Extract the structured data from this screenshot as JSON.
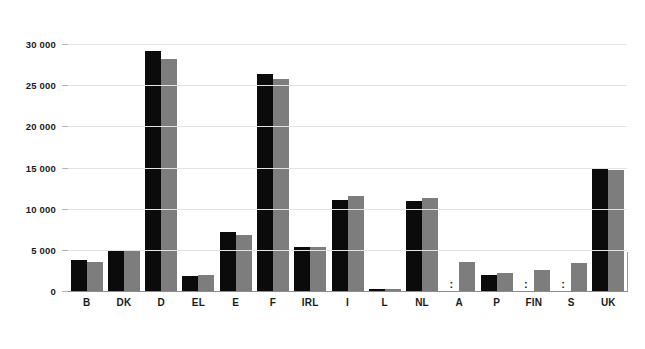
{
  "chart_data": {
    "type": "bar",
    "title": "",
    "subtitle": "",
    "xlabel": "",
    "ylabel": "",
    "ylim": [
      0,
      31000
    ],
    "grid": true,
    "legend_position": "none",
    "y_ticks": [
      0,
      5000,
      10000,
      15000,
      20000,
      25000,
      30000
    ],
    "y_tick_labels": [
      "0",
      "5 000",
      "10 000",
      "15 000",
      "20 000",
      "25 000",
      "30 000"
    ],
    "thousands_separator": " ",
    "na_symbol": ":",
    "colors": {
      "series_1": "#0b0b0b",
      "series_2": "#7d7d7d",
      "gridline": "#e3e3e3",
      "axis": "#8c8c8c",
      "background": "#ffffff",
      "text": "#1a1a1a"
    },
    "categories": [
      "B",
      "DK",
      "D",
      "EL",
      "E",
      "F",
      "IRL",
      "I",
      "L",
      "NL",
      "A",
      "P",
      "FIN",
      "S",
      "UK"
    ],
    "series": [
      {
        "name": "series_1",
        "color": "#0b0b0b",
        "values": [
          3750,
          4800,
          29100,
          1800,
          7200,
          26300,
          5350,
          11100,
          200,
          10900,
          null,
          1900,
          null,
          null,
          14850
        ]
      },
      {
        "name": "series_2",
        "color": "#7d7d7d",
        "values": [
          3500,
          4800,
          28200,
          2000,
          6800,
          25700,
          5350,
          11550,
          220,
          11350,
          3500,
          2200,
          2600,
          3450,
          14750
        ]
      }
    ]
  },
  "axes": {
    "y_labels": [
      {
        "value": 30000,
        "text": "30 000"
      },
      {
        "value": 25000,
        "text": "25 000"
      },
      {
        "value": 20000,
        "text": "20 000"
      },
      {
        "value": 15000,
        "text": "15 000"
      },
      {
        "value": 10000,
        "text": "10 000"
      },
      {
        "value": 5000,
        "text": "5 000"
      },
      {
        "value": 0,
        "text": "0"
      }
    ],
    "x_labels": [
      "B",
      "DK",
      "D",
      "EL",
      "E",
      "F",
      "IRL",
      "I",
      "L",
      "NL",
      "A",
      "P",
      "FIN",
      "S",
      "UK"
    ]
  },
  "markers": {
    "not_available": ":"
  }
}
